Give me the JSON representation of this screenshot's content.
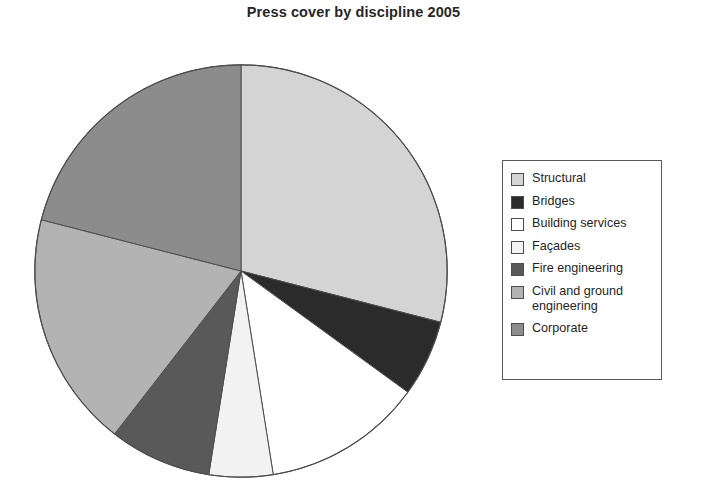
{
  "chart_data": {
    "type": "pie",
    "title": "Press cover by discipline 2005",
    "xlabel": "",
    "ylabel": "",
    "legend_position": "right",
    "grid": false,
    "start_angle_deg": 0,
    "direction": "clockwise",
    "categories": [
      "Structural",
      "Bridges",
      "Building services",
      "Façades",
      "Fire engineering",
      "Civil and ground engineering",
      "Corporate"
    ],
    "values": [
      29,
      6,
      12.5,
      5,
      8,
      18.5,
      21
    ],
    "unit": "percent",
    "slices": [
      {
        "label": "Structural",
        "value": 29,
        "angle_deg": 104.4,
        "start_deg": 0.0,
        "end_deg": 104.4,
        "color": "#d4d4d4"
      },
      {
        "label": "Bridges",
        "value": 6,
        "angle_deg": 21.6,
        "start_deg": 104.4,
        "end_deg": 126.0,
        "color": "#2b2b2b"
      },
      {
        "label": "Building services",
        "value": 12.5,
        "angle_deg": 45.0,
        "start_deg": 126.0,
        "end_deg": 171.0,
        "color": "#ffffff"
      },
      {
        "label": "Façades",
        "value": 5,
        "angle_deg": 18.0,
        "start_deg": 171.0,
        "end_deg": 189.0,
        "color": "#f2f2f2"
      },
      {
        "label": "Fire engineering",
        "value": 8,
        "angle_deg": 28.8,
        "start_deg": 189.0,
        "end_deg": 217.8,
        "color": "#595959"
      },
      {
        "label": "Civil and ground engineering",
        "value": 18.5,
        "angle_deg": 66.6,
        "start_deg": 217.8,
        "end_deg": 284.4,
        "color": "#b3b3b3"
      },
      {
        "label": "Corporate",
        "value": 21,
        "angle_deg": 75.6,
        "start_deg": 284.4,
        "end_deg": 360.0,
        "color": "#8c8c8c"
      }
    ]
  },
  "legend": {
    "items": [
      {
        "label": "Structural",
        "color": "#d4d4d4"
      },
      {
        "label": "Bridges",
        "color": "#2b2b2b"
      },
      {
        "label": "Building services",
        "color": "#ffffff"
      },
      {
        "label": "Façades",
        "color": "#f2f2f2"
      },
      {
        "label": "Fire engineering",
        "color": "#595959"
      },
      {
        "label": "Civil and ground\nengineering",
        "color": "#b3b3b3"
      },
      {
        "label": "Corporate",
        "color": "#8c8c8c"
      }
    ]
  },
  "style": {
    "background": "#ffffff",
    "outline": "#4d4d4d",
    "text": "#1f1f1f"
  }
}
